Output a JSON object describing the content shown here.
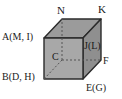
{
  "figure": {
    "type": "cube-diagram",
    "caption": "",
    "background_color": "#ffffff",
    "stroke_color": "#2b2b2b",
    "colors": {
      "front_face": "#a8a8a8",
      "top_face": "#9b9b9b",
      "right_face": "#8f8f8f",
      "outline": "#2b2b2b",
      "hidden_edge": "#6e6e6e",
      "label_text": "#1a1a1a"
    },
    "labels": [
      {
        "id": "N",
        "text": "N",
        "position": "top-front-left"
      },
      {
        "id": "K",
        "text": "K",
        "position": "top-back-right"
      },
      {
        "id": "A",
        "text": "A(M, I)",
        "position": "left-upper"
      },
      {
        "id": "J",
        "text": "J(L)",
        "position": "right-upper-inner"
      },
      {
        "id": "F",
        "text": "F",
        "position": "right-middle"
      },
      {
        "id": "B",
        "text": "B(D, H)",
        "position": "left-lower"
      },
      {
        "id": "E",
        "text": "E(G)",
        "position": "bottom-right"
      },
      {
        "id": "C",
        "text": "C",
        "position": "center-hidden-vertex"
      }
    ],
    "geometry": {
      "front_face": "44,38 83,38 83,79 44,79",
      "top_face": "44,38 62,19 101,19 83,38",
      "right_face": "83,38 101,19 101,60 83,79",
      "hidden_vertex": "62,60",
      "hidden_edges": [
        "62,60 62,19",
        "62,60 44,79",
        "62,60 101,60"
      ]
    }
  }
}
